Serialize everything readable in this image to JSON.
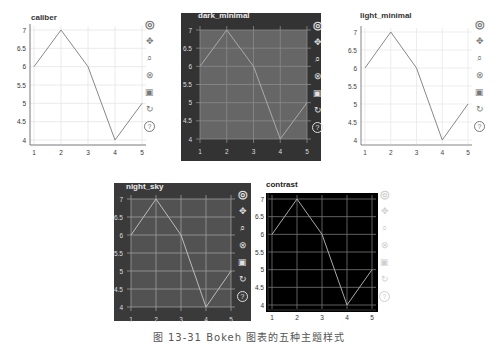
{
  "chart_data": [
    {
      "type": "line",
      "theme": "caliber",
      "title": "caliber",
      "x": [
        1,
        2,
        3,
        4,
        5
      ],
      "values": [
        6,
        7,
        6,
        4,
        5
      ],
      "xlabel": "",
      "ylabel": "",
      "xlim": [
        1,
        5
      ],
      "ylim": [
        4,
        7
      ],
      "xticks": [
        "1",
        "2",
        "3",
        "4",
        "5"
      ],
      "yticks": [
        "4",
        "4.5",
        "5",
        "5.5",
        "6",
        "6.5",
        "7"
      ],
      "grid": true
    },
    {
      "type": "line",
      "theme": "dark_minimal",
      "title": "dark_minimal",
      "x": [
        1,
        2,
        3,
        4,
        5
      ],
      "values": [
        6,
        7,
        6,
        4,
        5
      ],
      "xlabel": "",
      "ylabel": "",
      "xlim": [
        1,
        5
      ],
      "ylim": [
        4,
        7
      ],
      "xticks": [
        "1",
        "2",
        "3",
        "4",
        "5"
      ],
      "yticks": [
        "4",
        "4.5",
        "5",
        "5.5",
        "6",
        "6.5",
        "7"
      ],
      "grid": true
    },
    {
      "type": "line",
      "theme": "light_minimal",
      "title": "light_minimal",
      "x": [
        1,
        2,
        3,
        4,
        5
      ],
      "values": [
        6,
        7,
        6,
        4,
        5
      ],
      "xlabel": "",
      "ylabel": "",
      "xlim": [
        1,
        5
      ],
      "ylim": [
        4,
        7
      ],
      "xticks": [
        "1",
        "2",
        "3",
        "4",
        "5"
      ],
      "yticks": [
        "4",
        "4.5",
        "5",
        "5.5",
        "6",
        "6.5",
        "7"
      ],
      "grid": true
    },
    {
      "type": "line",
      "theme": "night_sky",
      "title": "night_sky",
      "x": [
        1,
        2,
        3,
        4,
        5
      ],
      "values": [
        6,
        7,
        6,
        4,
        5
      ],
      "xlabel": "",
      "ylabel": "",
      "xlim": [
        1,
        5
      ],
      "ylim": [
        4,
        7
      ],
      "xticks": [
        "1",
        "2",
        "3",
        "4",
        "5"
      ],
      "yticks": [
        "4",
        "4.5",
        "5",
        "5.5",
        "6",
        "6.5",
        "7"
      ],
      "grid": true
    },
    {
      "type": "line",
      "theme": "contrast",
      "title": "contrast",
      "x": [
        1,
        2,
        3,
        4,
        5
      ],
      "values": [
        6,
        7,
        6,
        4,
        5
      ],
      "xlabel": "",
      "ylabel": "",
      "xlim": [
        1,
        5
      ],
      "ylim": [
        4,
        7
      ],
      "xticks": [
        "1",
        "2",
        "3",
        "4",
        "5"
      ],
      "yticks": [
        "4",
        "4.5",
        "5",
        "5.5",
        "6",
        "6.5",
        "7"
      ],
      "grid": true
    }
  ],
  "toolbar": {
    "tools": [
      {
        "name": "bokeh-logo",
        "glyph": "◎"
      },
      {
        "name": "pan",
        "glyph": "✥"
      },
      {
        "name": "box-zoom",
        "glyph": "⌕"
      },
      {
        "name": "wheel-zoom",
        "glyph": "⊗"
      },
      {
        "name": "save",
        "glyph": "▣"
      },
      {
        "name": "reset",
        "glyph": "↻"
      },
      {
        "name": "help",
        "glyph": "?"
      }
    ]
  },
  "themes": {
    "caliber": {
      "bg": "#ffffff",
      "plot": "#ffffff",
      "grid": "#e4e4e4",
      "axis": "#555555",
      "text": "#333333",
      "line": "#888888",
      "title": "#333333",
      "tool": "#777777"
    },
    "dark_minimal": {
      "bg": "#333333",
      "plot": "#666666",
      "grid": "#8a8a8a",
      "axis": "#999999",
      "text": "#dddddd",
      "line": "#aaaaaa",
      "title": "#eeeeee",
      "tool": "#e0e0e0"
    },
    "light_minimal": {
      "bg": "#ffffff",
      "plot": "#ffffff",
      "grid": "#e8e8e8",
      "axis": "#666666",
      "text": "#444444",
      "line": "#888888",
      "title": "#333333",
      "tool": "#777777"
    },
    "night_sky": {
      "bg": "#3a3a3a",
      "plot": "#525252",
      "grid": "#9c9c9c",
      "axis": "#aaaaaa",
      "text": "#dddddd",
      "line": "#bbbbbb",
      "title": "#eeeeee",
      "tool": "#e0e0e0"
    },
    "contrast": {
      "bg": "#ffffff",
      "plot": "#000000",
      "grid": "#777777",
      "axis": "#444444",
      "text": "#333333",
      "line": "#aaaaaa",
      "title": "#222222",
      "tool": "#cfcfcf"
    }
  },
  "caption": "图 13-31  Bokeh 图表的五种主题样式"
}
